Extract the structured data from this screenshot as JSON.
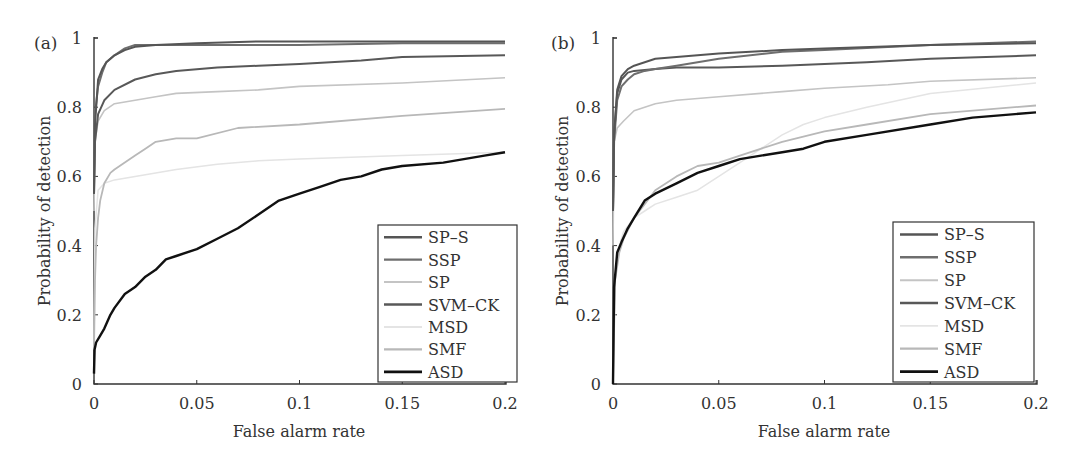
{
  "chart_data": [
    {
      "panel": "(a)",
      "type": "line",
      "title": "",
      "xlabel": "False alarm rate",
      "ylabel": "Probability of detection",
      "xlim": [
        0,
        0.2
      ],
      "ylim": [
        0,
        1
      ],
      "xticks": [
        "0",
        "0.05",
        "0.1",
        "0.15",
        "0.2"
      ],
      "yticks": [
        "0",
        "0.2",
        "0.4",
        "0.6",
        "0.8",
        "1"
      ],
      "grid": false,
      "legend_position": "lower right",
      "series": [
        {
          "name": "SP-S",
          "color": "#555555",
          "width": 2,
          "x": [
            0,
            0.0005,
            0.002,
            0.004,
            0.006,
            0.01,
            0.015,
            0.02,
            0.03,
            0.05,
            0.08,
            0.1,
            0.15,
            0.2
          ],
          "y": [
            0.55,
            0.75,
            0.88,
            0.91,
            0.93,
            0.95,
            0.965,
            0.975,
            0.98,
            0.985,
            0.99,
            0.99,
            0.99,
            0.99
          ]
        },
        {
          "name": "SSP",
          "color": "#6e6e6e",
          "width": 2,
          "x": [
            0,
            0.0005,
            0.002,
            0.004,
            0.006,
            0.01,
            0.015,
            0.02,
            0.03,
            0.05,
            0.08,
            0.1,
            0.15,
            0.2
          ],
          "y": [
            0.6,
            0.78,
            0.86,
            0.9,
            0.93,
            0.95,
            0.97,
            0.98,
            0.98,
            0.98,
            0.98,
            0.98,
            0.985,
            0.985
          ]
        },
        {
          "name": "SP",
          "color": "#c4c4c4",
          "width": 1.6,
          "x": [
            0,
            0.0005,
            0.002,
            0.005,
            0.01,
            0.02,
            0.03,
            0.04,
            0.06,
            0.08,
            0.1,
            0.15,
            0.2
          ],
          "y": [
            0.5,
            0.7,
            0.76,
            0.79,
            0.81,
            0.82,
            0.83,
            0.84,
            0.845,
            0.85,
            0.86,
            0.87,
            0.885
          ]
        },
        {
          "name": "SVM-CK",
          "color": "#585858",
          "width": 2,
          "x": [
            0,
            0.0005,
            0.002,
            0.005,
            0.01,
            0.02,
            0.03,
            0.04,
            0.06,
            0.08,
            0.1,
            0.13,
            0.15,
            0.2
          ],
          "y": [
            0.55,
            0.7,
            0.78,
            0.82,
            0.85,
            0.88,
            0.895,
            0.905,
            0.915,
            0.92,
            0.925,
            0.935,
            0.945,
            0.95
          ]
        },
        {
          "name": "MSD",
          "color": "#e4e4e4",
          "width": 1.5,
          "x": [
            0,
            0.0005,
            0.002,
            0.005,
            0.01,
            0.02,
            0.04,
            0.06,
            0.08,
            0.1,
            0.15,
            0.2
          ],
          "y": [
            0.1,
            0.45,
            0.56,
            0.58,
            0.59,
            0.6,
            0.62,
            0.635,
            0.645,
            0.65,
            0.66,
            0.67
          ]
        },
        {
          "name": "SMF",
          "color": "#b8b8b8",
          "width": 1.8,
          "x": [
            0,
            0.0005,
            0.001,
            0.002,
            0.003,
            0.005,
            0.008,
            0.01,
            0.015,
            0.02,
            0.025,
            0.03,
            0.04,
            0.05,
            0.07,
            0.1,
            0.15,
            0.2
          ],
          "y": [
            0.1,
            0.3,
            0.4,
            0.48,
            0.53,
            0.58,
            0.61,
            0.62,
            0.64,
            0.66,
            0.68,
            0.7,
            0.71,
            0.71,
            0.74,
            0.75,
            0.775,
            0.795
          ]
        },
        {
          "name": "ASD",
          "color": "#111111",
          "width": 2.4,
          "x": [
            0,
            0.0003,
            0.001,
            0.003,
            0.005,
            0.008,
            0.01,
            0.015,
            0.02,
            0.025,
            0.03,
            0.035,
            0.04,
            0.05,
            0.06,
            0.07,
            0.08,
            0.09,
            0.1,
            0.11,
            0.12,
            0.13,
            0.14,
            0.15,
            0.17,
            0.19,
            0.2
          ],
          "y": [
            0.03,
            0.1,
            0.12,
            0.14,
            0.16,
            0.2,
            0.22,
            0.26,
            0.28,
            0.31,
            0.33,
            0.36,
            0.37,
            0.39,
            0.42,
            0.45,
            0.49,
            0.53,
            0.55,
            0.57,
            0.59,
            0.6,
            0.62,
            0.63,
            0.64,
            0.66,
            0.67
          ]
        }
      ]
    },
    {
      "panel": "(b)",
      "type": "line",
      "title": "",
      "xlabel": "False alarm rate",
      "ylabel": "Probability of detection",
      "xlim": [
        0,
        0.2
      ],
      "ylim": [
        0,
        1
      ],
      "xticks": [
        "0",
        "0.05",
        "0.1",
        "0.15",
        "0.2"
      ],
      "yticks": [
        "0",
        "0.2",
        "0.4",
        "0.6",
        "0.8",
        "1"
      ],
      "grid": false,
      "legend_position": "lower right",
      "series": [
        {
          "name": "SP-S",
          "color": "#555555",
          "width": 2,
          "x": [
            0,
            0.0005,
            0.002,
            0.004,
            0.007,
            0.01,
            0.015,
            0.02,
            0.03,
            0.05,
            0.08,
            0.1,
            0.15,
            0.2
          ],
          "y": [
            0.5,
            0.72,
            0.85,
            0.89,
            0.91,
            0.92,
            0.93,
            0.94,
            0.945,
            0.955,
            0.965,
            0.97,
            0.98,
            0.985
          ]
        },
        {
          "name": "SSP",
          "color": "#6e6e6e",
          "width": 2,
          "x": [
            0,
            0.0005,
            0.002,
            0.004,
            0.007,
            0.01,
            0.015,
            0.02,
            0.03,
            0.05,
            0.08,
            0.1,
            0.15,
            0.2
          ],
          "y": [
            0.5,
            0.7,
            0.82,
            0.86,
            0.88,
            0.895,
            0.905,
            0.91,
            0.92,
            0.94,
            0.96,
            0.965,
            0.98,
            0.99
          ]
        },
        {
          "name": "SP",
          "color": "#c4c4c4",
          "width": 1.6,
          "x": [
            0,
            0.0005,
            0.002,
            0.005,
            0.01,
            0.02,
            0.03,
            0.05,
            0.08,
            0.1,
            0.13,
            0.15,
            0.2
          ],
          "y": [
            0.4,
            0.7,
            0.74,
            0.76,
            0.79,
            0.81,
            0.82,
            0.83,
            0.845,
            0.855,
            0.865,
            0.875,
            0.885
          ]
        },
        {
          "name": "SVM-CK",
          "color": "#585858",
          "width": 2,
          "x": [
            0,
            0.0005,
            0.002,
            0.004,
            0.007,
            0.01,
            0.02,
            0.03,
            0.05,
            0.08,
            0.1,
            0.12,
            0.15,
            0.2
          ],
          "y": [
            0.5,
            0.72,
            0.84,
            0.88,
            0.9,
            0.905,
            0.91,
            0.915,
            0.915,
            0.92,
            0.925,
            0.93,
            0.94,
            0.95
          ]
        },
        {
          "name": "MSD",
          "color": "#e4e4e4",
          "width": 1.5,
          "x": [
            0,
            0.001,
            0.003,
            0.005,
            0.01,
            0.015,
            0.02,
            0.03,
            0.04,
            0.05,
            0.06,
            0.07,
            0.08,
            0.09,
            0.1,
            0.12,
            0.15,
            0.2
          ],
          "y": [
            0.0,
            0.3,
            0.4,
            0.44,
            0.48,
            0.5,
            0.52,
            0.54,
            0.56,
            0.6,
            0.64,
            0.68,
            0.72,
            0.75,
            0.77,
            0.8,
            0.84,
            0.87
          ]
        },
        {
          "name": "SMF",
          "color": "#b8b8b8",
          "width": 1.8,
          "x": [
            0,
            0.001,
            0.003,
            0.005,
            0.01,
            0.015,
            0.02,
            0.03,
            0.04,
            0.05,
            0.06,
            0.08,
            0.1,
            0.12,
            0.15,
            0.2
          ],
          "y": [
            0.0,
            0.3,
            0.38,
            0.42,
            0.48,
            0.52,
            0.56,
            0.6,
            0.63,
            0.64,
            0.66,
            0.7,
            0.73,
            0.75,
            0.78,
            0.805
          ]
        },
        {
          "name": "ASD",
          "color": "#111111",
          "width": 2.4,
          "x": [
            0,
            0.0005,
            0.002,
            0.004,
            0.007,
            0.01,
            0.015,
            0.02,
            0.03,
            0.04,
            0.05,
            0.06,
            0.07,
            0.08,
            0.09,
            0.1,
            0.12,
            0.15,
            0.17,
            0.2
          ],
          "y": [
            0.0,
            0.28,
            0.38,
            0.41,
            0.45,
            0.48,
            0.53,
            0.55,
            0.58,
            0.61,
            0.63,
            0.65,
            0.66,
            0.67,
            0.68,
            0.7,
            0.72,
            0.75,
            0.77,
            0.785
          ]
        }
      ]
    }
  ],
  "panels": [
    {
      "label": "(a)",
      "xlabel": "False alarm rate",
      "ylabel": "Probability of detection"
    },
    {
      "label": "(b)",
      "xlabel": "False alarm rate",
      "ylabel": "Probability of detection"
    }
  ]
}
